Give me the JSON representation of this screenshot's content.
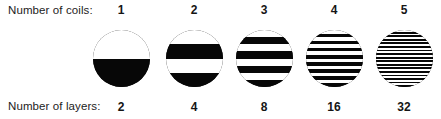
{
  "figure": {
    "background_color": "#ffffff",
    "ink_color": "#070707",
    "row_labels": {
      "coils": "Number of coils:",
      "layers": "Number of layers:"
    }
  },
  "chart_data": {
    "type": "diagram",
    "title": "",
    "subtitle": "",
    "xlabel": "Number of coils:",
    "ylabel": "Number of layers:",
    "categories": [
      "1",
      "2",
      "3",
      "4",
      "5"
    ],
    "values": [
      2,
      4,
      8,
      16,
      32
    ],
    "series": [
      {
        "name": "Number of coils",
        "values": [
          1,
          2,
          3,
          4,
          5
        ]
      },
      {
        "name": "Number of layers",
        "values": [
          2,
          4,
          8,
          16,
          32
        ]
      }
    ],
    "annotations": [
      "Each circle is a cross-section divided into alternating light and dark horizontal layers.",
      "Doubling the number of coils doubles the number of layers.",
      "Bottom text row is clipped by the image edge."
    ],
    "grid": false,
    "legend": "none"
  },
  "columns": [
    {
      "coils": "1",
      "layers": "2",
      "bands": 2,
      "first_band": "light",
      "center_x": 121
    },
    {
      "coils": "2",
      "layers": "4",
      "bands": 4,
      "first_band": "light",
      "center_x": 194
    },
    {
      "coils": "3",
      "layers": "8",
      "bands": 8,
      "first_band": "light",
      "center_x": 264
    },
    {
      "coils": "4",
      "layers": "16",
      "bands": 16,
      "first_band": "light",
      "center_x": 334
    },
    {
      "coils": "5",
      "layers": "32",
      "bands": 32,
      "first_band": "light",
      "center_x": 404
    }
  ]
}
